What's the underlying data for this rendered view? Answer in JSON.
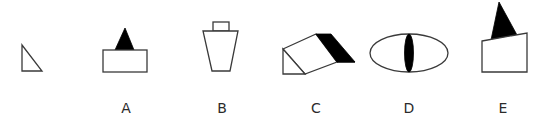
{
  "puzzle": {
    "question_figure": {
      "shape": "right-triangle",
      "points": [
        [
          22,
          45
        ],
        [
          22,
          71
        ],
        [
          42,
          71
        ]
      ]
    },
    "options": [
      {
        "label": "A",
        "label_pos": [
          126,
          113
        ],
        "description": "rectangle with black triangle on top",
        "outline": {
          "type": "rect",
          "x": 103,
          "y": 50,
          "w": 44,
          "h": 22
        },
        "solid": {
          "type": "polygon",
          "points": [
            [
              125,
              28
            ],
            [
              115,
              50
            ],
            [
              134,
              50
            ]
          ]
        }
      },
      {
        "label": "B",
        "label_pos": [
          222,
          113
        ],
        "description": "small rectangle on top of inverted trapezoid",
        "outline_top": {
          "type": "rect",
          "x": 213,
          "y": 22,
          "w": 16,
          "h": 9
        },
        "outline_body": {
          "type": "polygon",
          "points": [
            [
              203,
              31
            ],
            [
              238,
              31
            ],
            [
              230,
              71
            ],
            [
              212,
              71
            ]
          ]
        }
      },
      {
        "label": "C",
        "label_pos": [
          316,
          113
        ],
        "description": "triangular prism with black end band",
        "outline_triangle": {
          "type": "polygon",
          "points": [
            [
              283,
              49
            ],
            [
              283,
              74
            ],
            [
              305,
              74
            ]
          ]
        },
        "outline_face": {
          "type": "polygon",
          "points": [
            [
              283,
              49
            ],
            [
              316,
              34
            ],
            [
              337,
              62
            ],
            [
              305,
              74
            ]
          ]
        },
        "solid": {
          "type": "polygon",
          "points": [
            [
              316,
              34
            ],
            [
              331,
              34
            ],
            [
              355,
              62
            ],
            [
              337,
              62
            ]
          ]
        }
      },
      {
        "label": "D",
        "label_pos": [
          409,
          113
        ],
        "description": "ellipse with black vertical lens (cat eye)",
        "outline": {
          "type": "ellipse",
          "cx": 409,
          "cy": 53,
          "rx": 39,
          "ry": 19
        },
        "solid": {
          "type": "ellipse",
          "cx": 409,
          "cy": 53,
          "rx": 4.5,
          "ry": 19
        }
      },
      {
        "label": "E",
        "label_pos": [
          503,
          113
        ],
        "description": "quadrilateral with slanted top and black triangle",
        "outline": {
          "type": "polygon",
          "points": [
            [
              482,
              41
            ],
            [
              527,
              33
            ],
            [
              527,
              72
            ],
            [
              482,
              72
            ]
          ]
        },
        "solid": {
          "type": "polygon",
          "points": [
            [
              499,
              2
            ],
            [
              492,
              39
            ],
            [
              517,
              35
            ]
          ]
        }
      }
    ],
    "colors": {
      "stroke": "#3a3a3a",
      "fill_solid": "#000000",
      "background": "#ffffff",
      "label": "#2b2b2b"
    }
  }
}
